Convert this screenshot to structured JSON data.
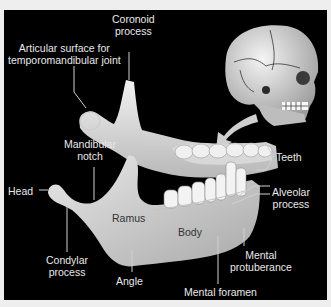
{
  "figure": {
    "colors": {
      "background": "#000000",
      "page": "#eeeeee",
      "bone": "#dcdcdc",
      "label_text": "#e9e9e9",
      "leader_line": "#d0d0d0"
    },
    "labels": {
      "coronoid_process": "Coronoid\nprocess",
      "coronoid_line1": "Coronoid",
      "coronoid_line2": "process",
      "articular_line1": "Articular surface for",
      "articular_line2": "temporomandibular joint",
      "teeth": "Teeth",
      "mandibular_notch_line1": "Mandibular",
      "mandibular_notch_line2": "notch",
      "head": "Head",
      "alveolar_line1": "Alveolar",
      "alveolar_line2": "process",
      "ramus": "Ramus",
      "body": "Body",
      "condylar_line1": "Condylar",
      "condylar_line2": "process",
      "mental_protuberance_line1": "Mental",
      "mental_protuberance_line2": "protuberance",
      "angle": "Angle",
      "mental_foramen": "Mental foramen"
    }
  }
}
